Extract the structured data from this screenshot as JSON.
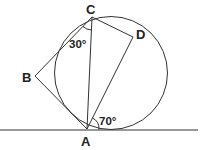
{
  "diagram": {
    "type": "circle-geometry",
    "points": {
      "A": {
        "label": "A"
      },
      "B": {
        "label": "B"
      },
      "C": {
        "label": "C"
      },
      "D": {
        "label": "D"
      }
    },
    "angles": {
      "BCA": {
        "label": "30°",
        "vertex": "C"
      },
      "DA_tangent": {
        "label": "70°",
        "vertex": "A"
      }
    },
    "elements": [
      "circle",
      "tangent line at A",
      "segment BC",
      "segment CA",
      "segment CD",
      "segment AB",
      "segment AD"
    ],
    "colors": {
      "stroke": "#222222",
      "background": "#ffffff"
    }
  }
}
